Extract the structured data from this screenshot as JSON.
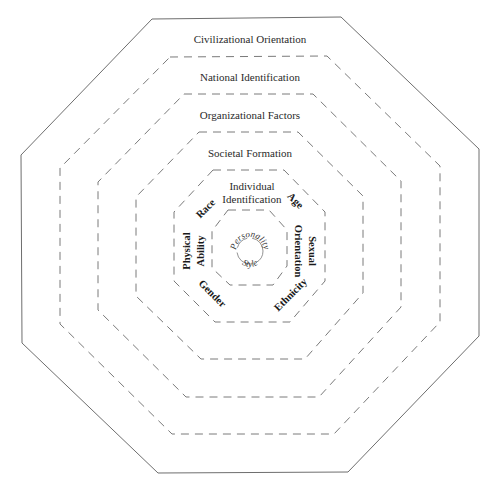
{
  "diagram": {
    "type": "concentric-octagons",
    "rings": [
      {
        "id": "civilizational",
        "label": "Civilizational Orientation",
        "style": "solid"
      },
      {
        "id": "national",
        "label": "National Identification",
        "style": "dashed"
      },
      {
        "id": "organizational",
        "label": "Organizational Factors",
        "style": "dashed"
      },
      {
        "id": "societal",
        "label": "Societal Formation",
        "style": "dashed"
      },
      {
        "id": "individual",
        "label_line1": "Individual",
        "label_line2": "Identification",
        "style": "dashed"
      },
      {
        "id": "core-ring",
        "style": "dashed"
      }
    ],
    "individual_factors": {
      "race": "Race",
      "age": "Age",
      "physical": "Physical",
      "ability": "Ability",
      "sexual": "Sexual",
      "orientation": "Orientation",
      "gender": "Gender",
      "ethnicity": "Ethnicity"
    },
    "core": {
      "top": "Personality",
      "bottom": "Style"
    },
    "colors": {
      "line": "#6e6e6e",
      "text": "#2a2a2a",
      "background": "#ffffff"
    }
  }
}
